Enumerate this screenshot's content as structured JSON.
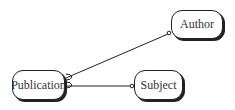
{
  "diagram": {
    "type": "entity-relationship",
    "entities": [
      {
        "id": "publication",
        "label": "Publication"
      },
      {
        "id": "author",
        "label": "Author"
      },
      {
        "id": "subject",
        "label": "Subject"
      }
    ],
    "relationships": [
      {
        "from": "publication",
        "to": "author",
        "from_end": "crows-foot",
        "to_end": "optional-circle"
      },
      {
        "from": "publication",
        "to": "subject",
        "from_end": "crows-foot",
        "to_end": "optional-circle"
      }
    ]
  }
}
